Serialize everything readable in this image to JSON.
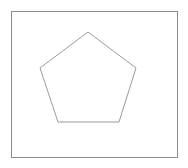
{
  "canvas": {
    "width": 188,
    "height": 168,
    "background_color": "#ffffff"
  },
  "frame": {
    "name": "bounding-box",
    "x": 11.5,
    "y": 11.5,
    "width": 166,
    "height": 146,
    "stroke_color": "#8c8c8c",
    "stroke_width": 1,
    "fill": "none"
  },
  "shape": {
    "name": "pentagon",
    "type": "regular-polygon",
    "sides": 5,
    "center_x": 88,
    "center_y": 84,
    "circumradius": 53,
    "rotation_deg": -90,
    "stroke_color": "#9a9a9a",
    "stroke_width": 1,
    "fill": "none",
    "points": "88,32 136.4,67.2 117.9,124.1 58.1,124.1 39.6,67.2",
    "vertices": [
      {
        "label": "apex",
        "x": 88,
        "y": 32
      },
      {
        "label": "upper-right",
        "x": 136,
        "y": 68
      },
      {
        "label": "lower-right",
        "x": 119,
        "y": 122
      },
      {
        "label": "lower-left",
        "x": 58,
        "y": 122
      },
      {
        "label": "upper-left",
        "x": 40,
        "y": 68
      }
    ]
  }
}
